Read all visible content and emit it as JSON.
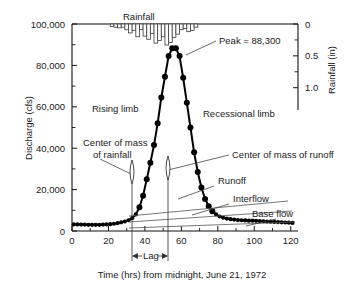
{
  "chart_data": {
    "type": "line",
    "title": "",
    "xlabel": "Time (hrs) from midnight, June 21, 1972",
    "ylabel": "Discharge (cfs)",
    "y2label": "Rainfall (in)",
    "xlim": [
      0,
      124
    ],
    "ylim": [
      0,
      100000
    ],
    "y2lim": [
      1.35,
      0
    ],
    "xticks": [
      0,
      20,
      40,
      60,
      80,
      100,
      120
    ],
    "xtick_labels": [
      "0",
      "20",
      "40",
      "60",
      "80",
      "100",
      "120"
    ],
    "x_minor_ticks": [
      10,
      30,
      50,
      70,
      90,
      110
    ],
    "yticks": [
      0,
      20000,
      40000,
      60000,
      80000,
      100000
    ],
    "ytick_labels": [
      "0",
      "20,000",
      "40,000",
      "60,000",
      "80,000",
      "100,000"
    ],
    "y_minor_ticks": [
      10000,
      30000,
      50000,
      70000,
      90000
    ],
    "y2ticks": [
      0,
      0.5,
      1.0
    ],
    "y2tick_labels": [
      "0",
      "0.5",
      "1.0"
    ],
    "y2_minor_ticks": [
      0.25,
      0.75
    ],
    "grid": false,
    "legend": "none",
    "series": [
      {
        "name": "Discharge hydrograph",
        "marker": "filled-circle",
        "x": [
          1,
          3,
          5,
          7,
          9,
          11,
          13,
          15,
          17,
          19,
          21,
          23,
          25,
          27,
          29,
          31,
          33,
          35,
          37,
          39,
          41,
          43,
          45,
          47,
          49,
          51,
          53,
          55,
          57,
          59,
          61,
          63,
          65,
          67,
          69,
          71,
          73,
          75,
          77,
          79,
          81,
          83,
          85,
          87,
          89,
          91,
          93,
          95,
          97,
          99,
          101,
          103,
          105,
          107,
          109,
          111,
          113,
          115,
          117,
          119,
          121
        ],
        "y": [
          3200,
          3200,
          3100,
          3100,
          3000,
          3000,
          3000,
          3000,
          3100,
          3200,
          3300,
          3500,
          3800,
          4200,
          4600,
          5200,
          6200,
          8000,
          11500,
          17000,
          25000,
          33000,
          41500,
          52000,
          64500,
          74500,
          84500,
          88300,
          88300,
          84500,
          74000,
          62000,
          50000,
          38000,
          28500,
          21000,
          15500,
          12000,
          9500,
          8000,
          7000,
          6400,
          6000,
          5700,
          5500,
          5300,
          5200,
          5100,
          5000,
          5000,
          4900,
          4800,
          4700,
          4600,
          4500,
          4400,
          4300,
          4200,
          4100,
          4000,
          3900
        ]
      },
      {
        "name": "Rainfall hyetograph",
        "type": "bar",
        "axis": "y2",
        "bar_x": [
          22,
          24,
          26,
          28,
          30,
          32,
          34,
          36,
          38,
          40,
          42,
          44,
          46,
          48,
          50,
          52,
          54,
          56,
          58,
          60,
          62,
          64,
          66,
          68
        ],
        "bar_width": 2,
        "bar_values": [
          0.04,
          0.05,
          0.06,
          0.05,
          0.09,
          0.14,
          0.1,
          0.2,
          0.09,
          0.19,
          0.24,
          0.15,
          0.3,
          0.26,
          0.2,
          0.33,
          0.29,
          0.21,
          0.16,
          0.09,
          0.07,
          0.12,
          0.1,
          0.05
        ]
      }
    ],
    "annotations": [
      {
        "name": "rainfall-title",
        "text": "Rainfall"
      },
      {
        "name": "peak-label",
        "text": "Peak = 88,300",
        "value": 88300
      },
      {
        "name": "rising-limb-label",
        "text": "Rising limb"
      },
      {
        "name": "recessional-limb-label",
        "text": "Recessional limb"
      },
      {
        "name": "center-of-mass-rainfall-label",
        "text_line1": "Center of mass",
        "text_line2": "of rainfall",
        "x_value": 33
      },
      {
        "name": "center-of-mass-runoff-label",
        "text": "Center of mass of runoff",
        "x_value": 55
      },
      {
        "name": "runoff-label",
        "text": "Runoff"
      },
      {
        "name": "interflow-label",
        "text": "Interflow"
      },
      {
        "name": "base-flow-label",
        "text": "Base flow"
      },
      {
        "name": "lag-label",
        "text": "Lag",
        "from_x": 33,
        "to_x": 55
      }
    ]
  },
  "axes": {
    "y_title": "Discharge (cfs)",
    "y2_title": "Rainfall (in)",
    "x_title": "Time (hrs) from midnight, June 21, 1972"
  },
  "colors": {
    "curve": "#000000",
    "bar_fill": "#ffffff",
    "bar_stroke": "#444444",
    "axis": "#111111",
    "text": "#1a1a1a",
    "background": "#ffffff"
  }
}
